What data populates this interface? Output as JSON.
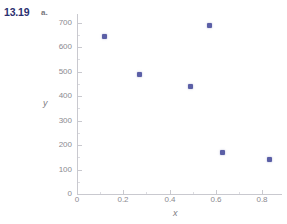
{
  "figure": {
    "problem_number": "13.19",
    "part": "a."
  },
  "chart_data": {
    "type": "scatter",
    "title": "",
    "subtitle": "",
    "xlabel": "x",
    "ylabel": "y",
    "xlim": [
      0,
      0.885
    ],
    "ylim": [
      0,
      740
    ],
    "grid": false,
    "legend": null,
    "marker": {
      "shape": "square",
      "color": "#5b5fa6",
      "size_px": 5
    },
    "axis_color": "#c9c9cf",
    "tick_label_color": "#8b8a90",
    "xticks": [
      0,
      0.2,
      0.4,
      0.6,
      0.8
    ],
    "xtick_labels": [
      "0",
      "0.2",
      "0.4",
      "0.6",
      "0.8"
    ],
    "yticks": [
      0,
      100,
      200,
      300,
      400,
      500,
      600,
      700
    ],
    "ytick_labels": [
      "0",
      "100",
      "200",
      "300",
      "400",
      "500",
      "600",
      "700"
    ],
    "x": [
      0.12,
      0.27,
      0.49,
      0.57,
      0.63,
      0.83
    ],
    "y": [
      645,
      490,
      440,
      690,
      168,
      140
    ],
    "points": [
      {
        "x": 0.12,
        "y": 645
      },
      {
        "x": 0.27,
        "y": 490
      },
      {
        "x": 0.49,
        "y": 440
      },
      {
        "x": 0.57,
        "y": 690
      },
      {
        "x": 0.63,
        "y": 168
      },
      {
        "x": 0.83,
        "y": 140
      }
    ]
  }
}
